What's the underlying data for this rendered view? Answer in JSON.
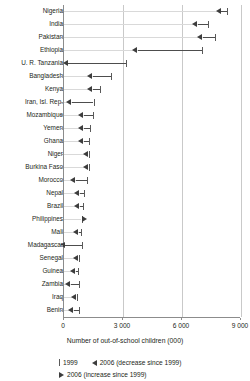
{
  "chart_data": {
    "type": "bar",
    "subtype": "dot-plot-arrow",
    "title": "",
    "xlabel": "Number of out-of-school children (000)",
    "ylabel": "",
    "xlim": [
      0,
      9000
    ],
    "xticks": [
      0,
      3000,
      6000,
      9000
    ],
    "xtick_labels": [
      "0",
      "3 000",
      "6 000",
      "9 000"
    ],
    "grid": "vertical",
    "legend_position": "below",
    "legend": [
      {
        "key": "1999",
        "label": "1999",
        "marker": "tick"
      },
      {
        "key": "2006_decrease",
        "label": "2006 (decrease since 1999)",
        "marker": "left-triangle"
      },
      {
        "key": "2006_increase",
        "label": "2006 (increase since 1999)",
        "marker": "right-triangle"
      }
    ],
    "series": [
      {
        "name": "1999",
        "values": [
          8300,
          7300,
          7700,
          7000,
          3150,
          2400,
          1850,
          1500,
          1450,
          1300,
          1250,
          1250,
          1250,
          1150,
          1000,
          950,
          900,
          850,
          900,
          750,
          700,
          750,
          650,
          750
        ]
      },
      {
        "name": "2006",
        "values": [
          8000,
          6800,
          7050,
          3750,
          200,
          1450,
          1450,
          400,
          1000,
          1000,
          1000,
          1250,
          1250,
          600,
          800,
          800,
          900,
          750,
          50,
          750,
          600,
          350,
          650,
          500
        ]
      }
    ],
    "categories": [
      "Nigeria",
      "India",
      "Pakistan",
      "Ethiopia",
      "U. R. Tanzania",
      "Bangladesh",
      "Kenya",
      "Iran, Isl. Rep.",
      "Mozambique",
      "Yemen",
      "Ghana",
      "Niger",
      "Burkina Faso",
      "Morocco",
      "Nepal",
      "Brazil",
      "Philippines",
      "Mali",
      "Madagascar",
      "Senegal",
      "Guinea",
      "Zambia",
      "Iraq",
      "Benin"
    ],
    "points": [
      {
        "country": "Nigeria",
        "v1999": 8300,
        "v2006": 8000,
        "direction": "decrease"
      },
      {
        "country": "India",
        "v1999": 7300,
        "v2006": 6800,
        "direction": "decrease"
      },
      {
        "country": "Pakistan",
        "v1999": 7700,
        "v2006": 7050,
        "direction": "decrease"
      },
      {
        "country": "Ethiopia",
        "v1999": 7000,
        "v2006": 3750,
        "direction": "decrease"
      },
      {
        "country": "U. R. Tanzania",
        "v1999": 3150,
        "v2006": 200,
        "direction": "decrease"
      },
      {
        "country": "Bangladesh",
        "v1999": 2400,
        "v2006": 1450,
        "direction": "decrease"
      },
      {
        "country": "Kenya",
        "v1999": 1850,
        "v2006": 1450,
        "direction": "decrease"
      },
      {
        "country": "Iran, Isl. Rep.",
        "v1999": 1500,
        "v2006": 400,
        "direction": "decrease"
      },
      {
        "country": "Mozambique",
        "v1999": 1450,
        "v2006": 1000,
        "direction": "decrease"
      },
      {
        "country": "Yemen",
        "v1999": 1300,
        "v2006": 1000,
        "direction": "decrease"
      },
      {
        "country": "Ghana",
        "v1999": 1250,
        "v2006": 1000,
        "direction": "decrease"
      },
      {
        "country": "Niger",
        "v1999": 1250,
        "v2006": 1250,
        "direction": "decrease"
      },
      {
        "country": "Burkina Faso",
        "v1999": 1250,
        "v2006": 1250,
        "direction": "decrease"
      },
      {
        "country": "Morocco",
        "v1999": 1150,
        "v2006": 600,
        "direction": "decrease"
      },
      {
        "country": "Nepal",
        "v1999": 1000,
        "v2006": 800,
        "direction": "decrease"
      },
      {
        "country": "Brazil",
        "v1999": 950,
        "v2006": 800,
        "direction": "decrease"
      },
      {
        "country": "Philippines",
        "v1999": 900,
        "v2006": 900,
        "direction": "increase"
      },
      {
        "country": "Mali",
        "v1999": 850,
        "v2006": 750,
        "direction": "decrease"
      },
      {
        "country": "Madagascar",
        "v1999": 900,
        "v2006": 50,
        "direction": "decrease"
      },
      {
        "country": "Senegal",
        "v1999": 750,
        "v2006": 750,
        "direction": "decrease"
      },
      {
        "country": "Guinea",
        "v1999": 700,
        "v2006": 600,
        "direction": "decrease"
      },
      {
        "country": "Zambia",
        "v1999": 750,
        "v2006": 350,
        "direction": "decrease"
      },
      {
        "country": "Iraq",
        "v1999": 650,
        "v2006": 650,
        "direction": "decrease"
      },
      {
        "country": "Benin",
        "v1999": 750,
        "v2006": 500,
        "direction": "decrease"
      }
    ]
  }
}
